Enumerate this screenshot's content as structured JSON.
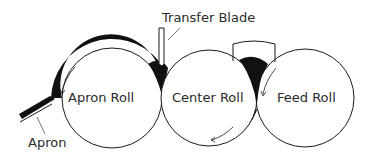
{
  "diagram": {
    "title": "",
    "labels": {
      "transfer_blade": "Transfer Blade",
      "apron_roll": "Apron Roll",
      "center_roll": "Center Roll",
      "feed_roll": "Feed Roll",
      "apron": "Apron"
    },
    "components": [
      {
        "id": "apron-roll",
        "label": "Apron Roll",
        "shape": "circle"
      },
      {
        "id": "center-roll",
        "label": "Center Roll",
        "shape": "circle"
      },
      {
        "id": "feed-roll",
        "label": "Feed Roll",
        "shape": "circle"
      },
      {
        "id": "transfer-blade",
        "label": "Transfer Blade",
        "shape": "blade"
      },
      {
        "id": "apron",
        "label": "Apron",
        "shape": "belt"
      },
      {
        "id": "feed-hopper",
        "label": "",
        "shape": "trough"
      }
    ],
    "rotation_arrows": [
      {
        "roll": "apron-roll",
        "direction": "counterclockwise"
      },
      {
        "roll": "center-roll",
        "direction": "clockwise"
      },
      {
        "roll": "feed-roll",
        "direction": "counterclockwise"
      }
    ],
    "colors": {
      "stroke": "#1a1a1a",
      "material": "#111111",
      "background": "#ffffff",
      "text": "#2a2a2a"
    }
  }
}
